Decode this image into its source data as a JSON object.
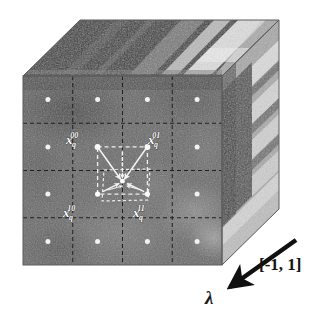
{
  "figure": {
    "canvas": {
      "width": 334,
      "height": 318,
      "background": "#ffffff"
    },
    "cube": {
      "front_face": {
        "x": 23,
        "y": 76,
        "width": 199,
        "height": 189,
        "fill": "#6a6a6a"
      },
      "top_face_label": "top-face",
      "right_face_label": "right-face",
      "grid": {
        "rows": 4,
        "cols": 4,
        "line_color": "#1c1c1c",
        "line_style": "dashed"
      },
      "depth_dx": 57,
      "depth_dy": -56
    },
    "sample_points": [
      {
        "id": "x_q_00",
        "base": "x",
        "sub": "q",
        "sup": "00",
        "label": "x",
        "cx": 95.5,
        "cy": 152.5,
        "label_x": 66,
        "label_y": 144
      },
      {
        "id": "x_q_01",
        "base": "x",
        "sub": "q",
        "sup": "01",
        "label": "x",
        "cx": 145.5,
        "cy": 152.5,
        "label_x": 148,
        "label_y": 144
      },
      {
        "id": "x_q_10",
        "base": "x",
        "sub": "q",
        "sup": "10",
        "label": "x",
        "cx": 95.5,
        "cy": 199.5,
        "label_x": 63,
        "label_y": 220
      },
      {
        "id": "x_q_11",
        "base": "x",
        "sub": "q",
        "sup": "11",
        "label": "x",
        "cx": 145.5,
        "cy": 199.5,
        "label_x": 133,
        "label_y": 220
      }
    ],
    "center_point": {
      "id": "x_q",
      "cx": 122,
      "cy": 181
    },
    "dot_color": "#f2f2f2",
    "dash_color": "#f0f0f0",
    "axis": {
      "name": "lambda",
      "symbol": "λ",
      "range_label": "[-1, 1]",
      "arrow": {
        "x1": 296,
        "y1": 240,
        "x2": 228,
        "y2": 288
      },
      "symbol_pos": {
        "x": 210,
        "y": 302
      },
      "range_pos": {
        "x": 259,
        "y": 270
      }
    },
    "colors": {
      "front_face": "#6a6a6a",
      "top_face": "#4a4a4a",
      "right_face": "#9a9a9a",
      "dot": "#f2f2f2",
      "dash": "#efefef",
      "grid_line": "#1c1c1c",
      "axis_arrow": "#101010",
      "text_dark": "#141414",
      "text_light": "#ffffff",
      "background": "#ffffff"
    }
  }
}
